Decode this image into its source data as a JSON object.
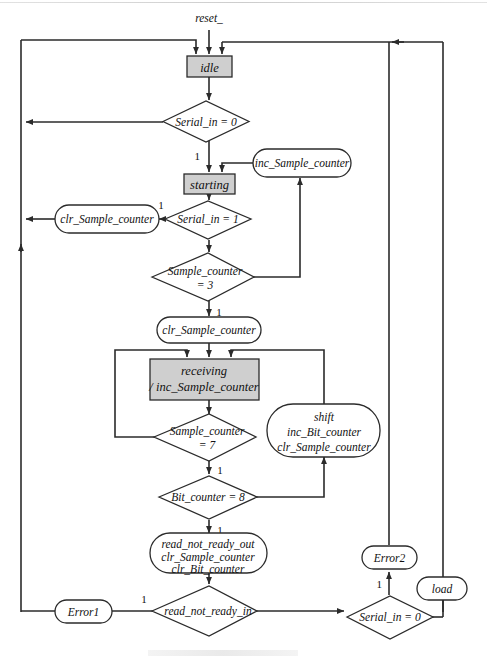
{
  "diagram": {
    "type": "asm-flowchart",
    "input_signal": "reset_",
    "states": [
      {
        "id": "idle",
        "label": "idle"
      },
      {
        "id": "starting",
        "label": "starting"
      },
      {
        "id": "receiving",
        "label_line1": "receiving",
        "label_line2": "/ inc_Sample_counter"
      }
    ],
    "decisions": [
      {
        "id": "serial_in_0_top",
        "label": "Serial_in = 0",
        "true_label": "1"
      },
      {
        "id": "serial_in_1",
        "label": "Serial_in = 1",
        "true_label": "1"
      },
      {
        "id": "sample_counter_3",
        "label_line1": "Sample_counter",
        "label_line2": "= 3",
        "true_label": "1"
      },
      {
        "id": "sample_counter_7",
        "label_line1": "Sample_counter",
        "label_line2": "= 7",
        "true_label": "1"
      },
      {
        "id": "bit_counter_8",
        "label": "Bit_counter = 8",
        "true_label": "1"
      },
      {
        "id": "read_not_ready_in",
        "label": "read_not_ready_in",
        "true_label": "1"
      },
      {
        "id": "serial_in_0_bottom",
        "label": "Serial_in = 0",
        "true_label": "1"
      }
    ],
    "outputs": [
      {
        "id": "inc_sample_counter_top",
        "label": "inc_Sample_counter"
      },
      {
        "id": "clr_sample_counter_left",
        "label": "clr_Sample_counter"
      },
      {
        "id": "clr_sample_counter_mid",
        "label": "clr_Sample_counter"
      },
      {
        "id": "shift_block",
        "line1": "shift",
        "line2": "inc_Bit_counter",
        "line3": "clr_Sample_counter"
      },
      {
        "id": "read_not_ready_block",
        "line1": "read_not_ready_out",
        "line2": "clr_Sample_counter",
        "line3": "clr_Bit_counter"
      },
      {
        "id": "error1",
        "label": "Error1"
      },
      {
        "id": "error2",
        "label": "Error2"
      },
      {
        "id": "load",
        "label": "load"
      }
    ],
    "branch_labels": {
      "one": "1"
    },
    "colors": {
      "state_fill": "#cfcfcf",
      "shape_stroke": "#2b2b2b",
      "edge": "#2b2b2b",
      "background": "#ffffff",
      "text": "#111111"
    }
  }
}
